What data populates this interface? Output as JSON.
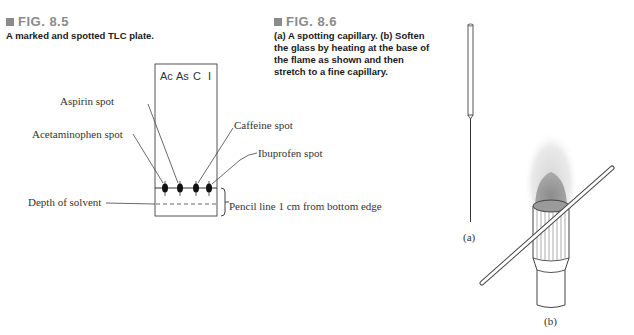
{
  "fig85": {
    "number": "FIG. 8.5",
    "caption": "A marked and spotted TLC plate.",
    "lane_labels": [
      "Ac",
      "As",
      "C",
      "I"
    ],
    "labels": {
      "aspirin": "Aspirin spot",
      "acetaminophen": "Acetaminophen spot",
      "caffeine": "Caffeine spot",
      "ibuprofen": "Ibuprofen spot",
      "solvent": "Depth of solvent",
      "pencil": "Pencil line 1 cm from bottom edge"
    }
  },
  "fig86": {
    "number": "FIG. 8.6",
    "caption_lines": [
      "(a) A spotting capillary. (b) Soften",
      "the glass by heating at the base of",
      "the flame as shown and then",
      "stretch to a fine capillary."
    ],
    "label_a": "(a)",
    "label_b": "(b)"
  }
}
